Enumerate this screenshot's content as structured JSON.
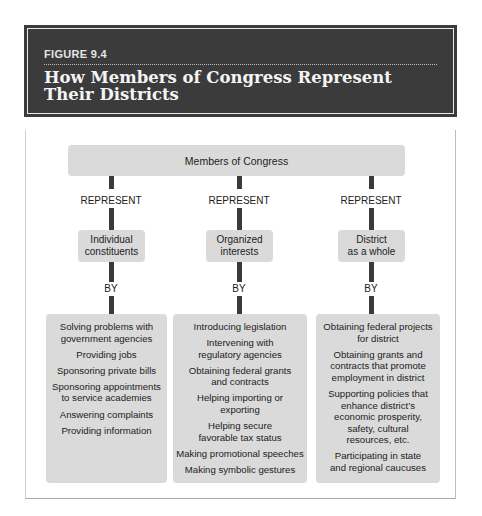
{
  "figure": {
    "label": "FIGURE 9.4",
    "title": "How Members of Congress Represent Their Districts",
    "colors": {
      "header_bg": "#3b3b3b",
      "box_fill": "#dadada",
      "connector": "#3a3a3a"
    }
  },
  "diagram": {
    "root": "Members of Congress",
    "connector_top": "REPRESENT",
    "connector_bottom": "BY",
    "columns": [
      {
        "category": "Individual\nconstituents",
        "items": [
          "Solving problems with\ngovernment agencies",
          "Providing jobs",
          "Sponsoring private bills",
          "Sponsoring appointments\nto service academies",
          "Answering complaints",
          "Providing information"
        ]
      },
      {
        "category": "Organized\ninterests",
        "items": [
          "Introducing legislation",
          "Intervening with\nregulatory agencies",
          "Obtaining federal grants\nand contracts",
          "Helping importing or\nexporting",
          "Helping secure\nfavorable tax status",
          "Making promotional speeches",
          "Making symbolic gestures"
        ]
      },
      {
        "category": "District\nas a whole",
        "items": [
          "Obtaining federal projects\nfor district",
          "Obtaining grants and\ncontracts that promote\nemployment in district",
          "Supporting policies that\nenhance district’s\neconomic prosperity,\nsafety, cultural\nresources, etc.",
          "Participating in state\nand regional caucuses"
        ]
      }
    ]
  }
}
